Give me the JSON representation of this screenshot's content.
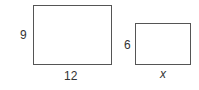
{
  "figure": {
    "rectangles": [
      {
        "name": "large-rectangle",
        "height_label": "9",
        "width_label": "12"
      },
      {
        "name": "small-rectangle",
        "height_label": "6",
        "width_label": "x"
      }
    ]
  }
}
